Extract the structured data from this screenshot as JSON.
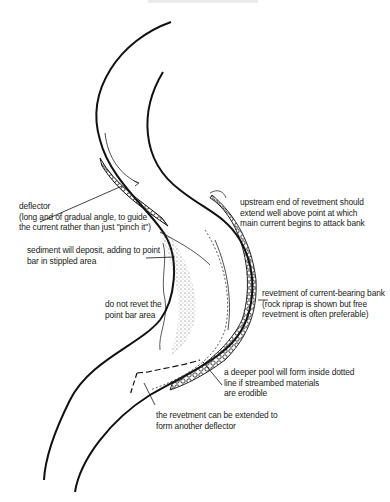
{
  "diagram": {
    "type": "river-bend-revetment-sketch",
    "colors": {
      "ink": "#111111",
      "background": "#ffffff"
    },
    "labels": {
      "deflector": "deflector\n(long and of gradual angle, to guide\nthe current rather than just \"pinch it\")",
      "sediment": "sediment will deposit, adding to point\nbar in stippled area",
      "point_bar": "do not revet the\npoint bar area",
      "upstream": "upstream end of revetment should\nextend well above point at which\nmain current begins to attack bank",
      "revetment": "revetment of current-bearing bank\n(rock riprap is shown but free\nrevetment is often preferable)",
      "pool": "a deeper pool will form inside dotted\nline if streambed materials\nare erodible",
      "extend": "the revetment can be extended to\nform another deflector"
    }
  }
}
